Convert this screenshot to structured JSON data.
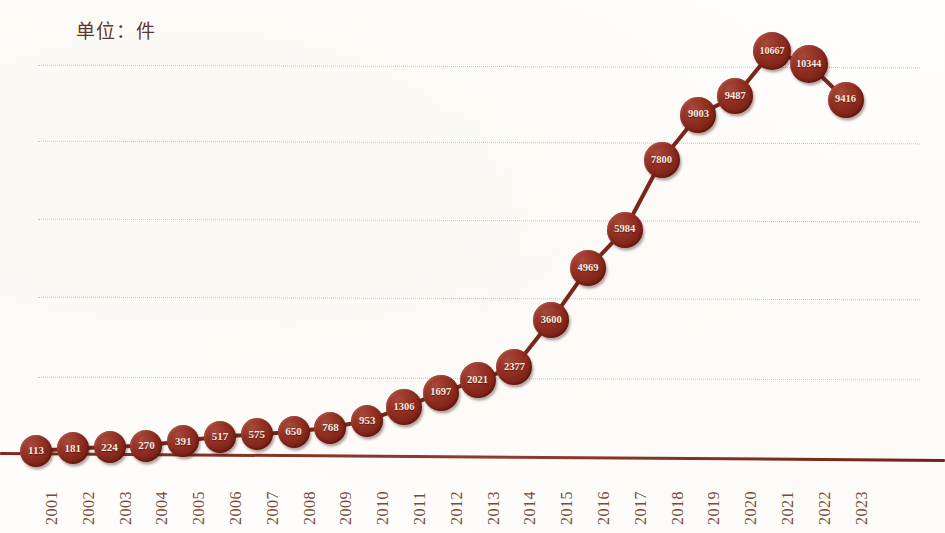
{
  "chart_data": {
    "type": "line",
    "title": "单位：件",
    "subtitle": "",
    "xlabel": "",
    "ylabel": "",
    "unit_note": "单位：件",
    "legend": [],
    "legend_position": "none",
    "grid": true,
    "gridlines_count": 5,
    "ylim": [
      0,
      12000
    ],
    "categories": [
      "2001",
      "2002",
      "2003",
      "2004",
      "2005",
      "2006",
      "2007",
      "2008",
      "2009",
      "2010",
      "2011",
      "2012",
      "2013",
      "2014",
      "2015",
      "2016",
      "2017",
      "2018",
      "2019",
      "2020",
      "2021",
      "2022",
      "2023"
    ],
    "values": [
      113,
      181,
      224,
      270,
      391,
      517,
      575,
      650,
      768,
      953,
      1306,
      1697,
      2021,
      2377,
      3600,
      4969,
      5984,
      7800,
      9003,
      9487,
      10667,
      10344,
      9416
    ],
    "data_labels": [
      "113",
      "181",
      "224",
      "270",
      "391",
      "517",
      "575",
      "650",
      "768",
      "953",
      "1306",
      "1697",
      "2021",
      "2377",
      "3600",
      "4969",
      "5984",
      "7800",
      "9003",
      "9487",
      "10667",
      "10344",
      "9416"
    ],
    "marker_color": "#8e3022",
    "marker_label_color": "#f6ece2",
    "line_color": "#7a2718",
    "gridline_color": "#e0b9ad",
    "axis_color": "#7e2b20",
    "tick_label_color": "#7a4a38",
    "title_color": "#5d3730",
    "background_color": "#fefdfc"
  }
}
